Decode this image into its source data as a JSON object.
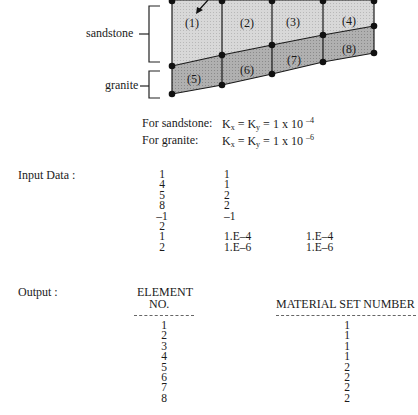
{
  "diagram": {
    "layers": [
      {
        "name": "sandstone",
        "color": "#dcdcdc"
      },
      {
        "name": "granite",
        "color": "#b4b4b4"
      }
    ],
    "elements": [
      "(1)",
      "(2)",
      "(3)",
      "(4)",
      "(5)",
      "(6)",
      "(7)",
      "(8)"
    ]
  },
  "properties": {
    "sandstone": {
      "label": "For sandstone:",
      "value_prefix": "K",
      "sub1": "x",
      "mid": " = K",
      "sub2": "y",
      "tail": " = 1 x 10 ",
      "exp": "–4"
    },
    "granite": {
      "label": "For granite:",
      "value_prefix": "K",
      "sub1": "x",
      "mid": " = K",
      "sub2": "y",
      "tail": " = 1 x 10 ",
      "exp": "–6"
    }
  },
  "input": {
    "label": "Input Data :",
    "col1": [
      "1",
      "4",
      "5",
      "8",
      "–1",
      "2",
      "1",
      "2"
    ],
    "col2": [
      "1",
      "1",
      "2",
      "2",
      "–1",
      "",
      "1.E–4",
      "1.E–6"
    ],
    "col3": [
      "",
      "",
      "",
      "",
      "",
      "",
      "1.E–4",
      "1.E–6"
    ]
  },
  "output": {
    "label": "Output :",
    "header_element_1": "ELEMENT",
    "header_element_2": "NO.",
    "header_material": "MATERIAL SET NUMBER",
    "rows": [
      {
        "element": "1",
        "material": "1"
      },
      {
        "element": "2",
        "material": "1"
      },
      {
        "element": "3",
        "material": "1"
      },
      {
        "element": "4",
        "material": "1"
      },
      {
        "element": "5",
        "material": "2"
      },
      {
        "element": "6",
        "material": "2"
      },
      {
        "element": "7",
        "material": "2"
      },
      {
        "element": "8",
        "material": "2"
      }
    ]
  }
}
